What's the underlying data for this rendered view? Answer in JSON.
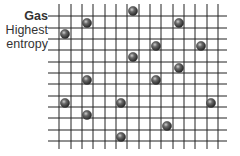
{
  "labels": {
    "title": "Gas",
    "line1": "Highest",
    "line2": "entropy"
  },
  "grid": {
    "x_lines": [
      59,
      71,
      82,
      93,
      105,
      116,
      127,
      139,
      150,
      161,
      173,
      184,
      195,
      207,
      218
    ],
    "y_lines": [
      16,
      28,
      39,
      50,
      62,
      73,
      84,
      96,
      107,
      118,
      130,
      141
    ],
    "x_min": 48,
    "x_max": 227,
    "y_min": 4,
    "y_max": 149,
    "line_color": "#222222"
  },
  "particles": [
    {
      "x": 133,
      "y": 11
    },
    {
      "x": 87,
      "y": 23
    },
    {
      "x": 179,
      "y": 23
    },
    {
      "x": 65,
      "y": 34
    },
    {
      "x": 156,
      "y": 46
    },
    {
      "x": 201,
      "y": 46
    },
    {
      "x": 133,
      "y": 57
    },
    {
      "x": 179,
      "y": 68
    },
    {
      "x": 87,
      "y": 80
    },
    {
      "x": 156,
      "y": 80
    },
    {
      "x": 65,
      "y": 103
    },
    {
      "x": 121,
      "y": 103
    },
    {
      "x": 211,
      "y": 103
    },
    {
      "x": 87,
      "y": 115
    },
    {
      "x": 167,
      "y": 126
    },
    {
      "x": 121,
      "y": 137
    }
  ],
  "particle_radius": 4.6,
  "particle_color": "#3a3a3a"
}
